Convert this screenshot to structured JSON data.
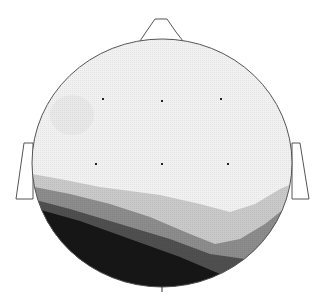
{
  "figure": {
    "type": "scalp-topography-map",
    "head": {
      "cx": 162,
      "cy": 163,
      "rx": 130,
      "ry": 124,
      "outline_color": "#555555"
    },
    "nose": {
      "points": "140,41 146,32 155,19 167,19 176,32 183,41"
    },
    "ears": {
      "left": {
        "points": "33,143 24,143 16,199 33,199"
      },
      "right": {
        "points": "292,143 300,143 309,199 292,199"
      }
    },
    "bottom_tick": {
      "x": 162,
      "y1": 287,
      "y2": 292
    },
    "electrodes": [
      {
        "x": 103,
        "y": 99
      },
      {
        "x": 162,
        "y": 101
      },
      {
        "x": 221,
        "y": 99
      },
      {
        "x": 96,
        "y": 164
      },
      {
        "x": 162,
        "y": 164
      },
      {
        "x": 228,
        "y": 164
      }
    ],
    "bands": [
      {
        "level": 1,
        "color": "#f1f1f1",
        "path": "M0,0 L323,0 L323,303 L0,303 Z"
      },
      {
        "level": 2,
        "color": "#c9c9c9",
        "path": "M20,172 L60,179 L100,187 L160,195 L200,204 L230,212 L255,204 L280,189 L305,178 L323,178 L323,303 L0,303 L0,172 Z"
      },
      {
        "level": 3,
        "color": "#8c8c8c",
        "path": "M20,184 L70,194 L110,204 L150,217 L190,234 L215,244 L240,239 L265,224 L290,204 L323,200 L323,303 L0,303 L0,184 Z"
      },
      {
        "level": 4,
        "color": "#4f4f4f",
        "path": "M20,196 L70,209 L120,224 L170,239 L210,254 L245,259 L275,234 L300,215 L323,215 L323,303 L0,303 L0,196 Z"
      },
      {
        "level": 5,
        "color": "#161616",
        "path": "M20,204 L80,221 L130,239 L180,257 L220,274 L250,269 L285,240 L323,235 L323,303 L0,303 L0,204 Z"
      }
    ],
    "faint_patch": {
      "cx": 72,
      "cy": 115,
      "rx": 22,
      "ry": 20,
      "color": "#e6e6e6"
    }
  }
}
